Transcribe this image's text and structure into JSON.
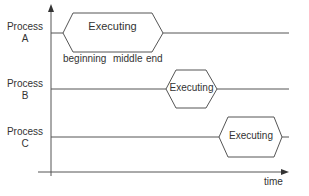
{
  "diagram": {
    "type": "process timeline",
    "axis": {
      "x_label": "time"
    },
    "processes": [
      {
        "name_line1": "Process",
        "name_line2": "A",
        "state": "Executing",
        "phases": [
          "beginning",
          "middle",
          "end"
        ]
      },
      {
        "name_line1": "Process",
        "name_line2": "B",
        "state": "Executing"
      },
      {
        "name_line1": "Process",
        "name_line2": "C",
        "state": "Executing"
      }
    ],
    "colors": {
      "line": "#555555",
      "text": "#333333",
      "background": "#ffffff"
    }
  }
}
